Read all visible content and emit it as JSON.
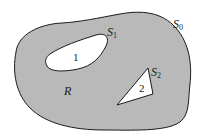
{
  "diagram": {
    "type": "region-with-holes",
    "colors": {
      "region_fill": "#b9b9b9",
      "hole_fill": "#ffffff",
      "stroke": "#1a1a1a",
      "background": "#ffffff"
    },
    "outer_boundary": {
      "label_main": "S",
      "label_sub": "0"
    },
    "region": {
      "label": "R"
    },
    "holes": [
      {
        "number": "1",
        "shape": "rounded-oval",
        "boundary_label_main": "S",
        "boundary_label_sub": "1"
      },
      {
        "number": "2",
        "shape": "triangle",
        "boundary_label_main": "S",
        "boundary_label_sub": "2"
      }
    ]
  }
}
